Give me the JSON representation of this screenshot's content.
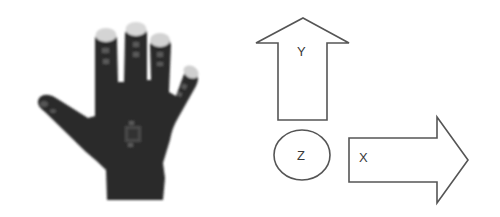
{
  "figure": {
    "glove": {
      "name": "sensor-glove",
      "fill_color": "#2b2b2b",
      "fingertip_color": "#d4d4d4",
      "sensor_color": "#5a5a5a"
    },
    "axes": {
      "stroke_color": "#555555",
      "fill_color": "#ffffff",
      "y_label": "Y",
      "z_label": "Z",
      "x_label": "X"
    }
  }
}
